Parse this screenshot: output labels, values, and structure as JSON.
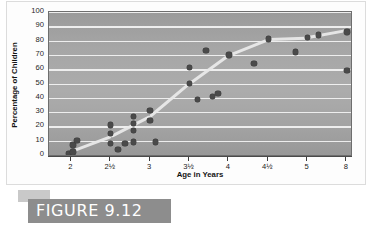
{
  "figure": {
    "caption": "FIGURE 9.12"
  },
  "chart_data": {
    "type": "scatter",
    "title": "",
    "xlabel": "Age in Years",
    "ylabel": "Percentage of Children",
    "xlim": [
      1.85,
      8.35
    ],
    "ylim": [
      0,
      100
    ],
    "grid": true,
    "legend": false,
    "ytick_labels": [
      "100",
      "90",
      "80",
      "70",
      "60",
      "50",
      "40",
      "30",
      "20",
      "10",
      "0"
    ],
    "ytick_values": [
      100,
      90,
      80,
      70,
      60,
      50,
      40,
      30,
      20,
      10,
      0
    ],
    "xtick_labels": [
      "2",
      "2½",
      "3",
      "3½",
      "4",
      "4½",
      "5",
      "8"
    ],
    "xtick_values": [
      2,
      2.5,
      3,
      3.5,
      4,
      4.5,
      5,
      8
    ],
    "points": [
      {
        "x": 1.97,
        "y": 1
      },
      {
        "x": 2.02,
        "y": 2
      },
      {
        "x": 2.02,
        "y": 7
      },
      {
        "x": 2.07,
        "y": 10
      },
      {
        "x": 2.5,
        "y": 8
      },
      {
        "x": 2.5,
        "y": 15
      },
      {
        "x": 2.5,
        "y": 21
      },
      {
        "x": 2.59,
        "y": 4
      },
      {
        "x": 2.68,
        "y": 8
      },
      {
        "x": 2.79,
        "y": 9
      },
      {
        "x": 2.79,
        "y": 17
      },
      {
        "x": 2.79,
        "y": 22
      },
      {
        "x": 2.79,
        "y": 27
      },
      {
        "x": 3.0,
        "y": 24
      },
      {
        "x": 3.0,
        "y": 31
      },
      {
        "x": 3.07,
        "y": 9
      },
      {
        "x": 3.5,
        "y": 50
      },
      {
        "x": 3.5,
        "y": 61
      },
      {
        "x": 3.6,
        "y": 39
      },
      {
        "x": 3.71,
        "y": 73
      },
      {
        "x": 3.79,
        "y": 41
      },
      {
        "x": 3.86,
        "y": 43
      },
      {
        "x": 4.0,
        "y": 70
      },
      {
        "x": 4.32,
        "y": 64
      },
      {
        "x": 4.5,
        "y": 81
      },
      {
        "x": 4.85,
        "y": 72
      },
      {
        "x": 5.0,
        "y": 82
      },
      {
        "x": 5.85,
        "y": 84
      },
      {
        "x": 8.0,
        "y": 59
      },
      {
        "x": 8.0,
        "y": 86
      }
    ],
    "trend_line": {
      "label": "trend",
      "color": "#e9e9e9",
      "points": [
        {
          "x": 1.97,
          "y": 2
        },
        {
          "x": 2.5,
          "y": 13
        },
        {
          "x": 3.0,
          "y": 27
        },
        {
          "x": 3.5,
          "y": 50
        },
        {
          "x": 4.0,
          "y": 70
        },
        {
          "x": 4.5,
          "y": 81
        },
        {
          "x": 5.0,
          "y": 82
        },
        {
          "x": 8.0,
          "y": 87
        }
      ]
    }
  }
}
